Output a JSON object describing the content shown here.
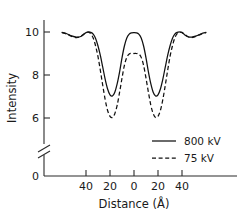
{
  "chart_data": {
    "type": "line",
    "title": "",
    "xlabel": "Distance (Å)",
    "ylabel": "Intensity",
    "xlim": [
      -60,
      60
    ],
    "ylim_display": [
      0,
      10.6
    ],
    "y_axis_break": true,
    "y_axis_break_note": "axis broken between 0 and ~5.2",
    "grid": false,
    "legend_position": "lower-right",
    "xticks": [
      -40,
      -20,
      0,
      20,
      40
    ],
    "xtick_labels": [
      "40",
      "20",
      "0",
      "20",
      "40"
    ],
    "yticks": [
      6,
      8,
      10,
      0
    ],
    "ytick_labels": [
      "6",
      "8",
      "10",
      "0"
    ],
    "series": [
      {
        "name": "800 kV",
        "style": "solid",
        "color": "#111111",
        "x": [
          -60,
          -56,
          -52,
          -48,
          -45,
          -42,
          -40,
          -38,
          -36,
          -34,
          -32,
          -30,
          -28,
          -26,
          -24,
          -22,
          -20,
          -18,
          -16,
          -14,
          -12,
          -10,
          -8,
          -6,
          -4,
          -2,
          0,
          2,
          4,
          6,
          8,
          10,
          12,
          14,
          16,
          18,
          20,
          22,
          24,
          26,
          28,
          30,
          32,
          34,
          36,
          38,
          40,
          42,
          45,
          48,
          52,
          56,
          60
        ],
        "y": [
          9.98,
          9.92,
          9.82,
          9.76,
          9.78,
          9.88,
          9.97,
          10.0,
          9.98,
          9.9,
          9.7,
          9.35,
          8.9,
          8.35,
          7.8,
          7.35,
          7.08,
          7.02,
          7.2,
          7.6,
          8.15,
          8.8,
          9.35,
          9.72,
          9.9,
          9.96,
          9.97,
          9.96,
          9.9,
          9.72,
          9.35,
          8.8,
          8.15,
          7.6,
          7.2,
          7.02,
          7.08,
          7.35,
          7.8,
          8.35,
          8.9,
          9.35,
          9.7,
          9.9,
          9.98,
          10.0,
          9.97,
          9.88,
          9.78,
          9.76,
          9.82,
          9.92,
          9.98
        ]
      },
      {
        "name": "75 kV",
        "style": "dashed",
        "color": "#111111",
        "x": [
          -60,
          -56,
          -52,
          -48,
          -45,
          -42,
          -40,
          -38,
          -36,
          -34,
          -32,
          -30,
          -28,
          -26,
          -24,
          -22,
          -20,
          -18,
          -16,
          -14,
          -12,
          -10,
          -8,
          -6,
          -4,
          -2,
          0,
          2,
          4,
          6,
          8,
          10,
          12,
          14,
          16,
          18,
          20,
          22,
          24,
          26,
          28,
          30,
          32,
          34,
          36,
          38,
          40,
          42,
          45,
          48,
          52,
          56,
          60
        ],
        "y": [
          9.97,
          9.9,
          9.8,
          9.74,
          9.78,
          9.9,
          9.98,
          9.99,
          9.92,
          9.72,
          9.35,
          8.85,
          8.2,
          7.5,
          6.85,
          6.35,
          6.08,
          6.02,
          6.2,
          6.6,
          7.2,
          7.85,
          8.45,
          8.82,
          8.98,
          9.0,
          9.0,
          9.0,
          8.98,
          8.82,
          8.45,
          7.85,
          7.2,
          6.6,
          6.2,
          6.02,
          6.08,
          6.35,
          6.85,
          7.5,
          8.2,
          8.85,
          9.35,
          9.72,
          9.92,
          9.99,
          9.98,
          9.9,
          9.78,
          9.74,
          9.8,
          9.9,
          9.97
        ]
      }
    ],
    "annotations": {
      "peak_center_solid": 10.0,
      "peak_center_dashed": 9.0,
      "valley_min_solid": 7.0,
      "valley_min_dashed": 6.0,
      "valley_positions": [
        -20,
        20
      ]
    }
  },
  "axes": {
    "ylabel": "Intensity",
    "xlabel": "Distance (Å)",
    "ytick_labels": [
      "10",
      "8",
      "6",
      "0"
    ],
    "xtick_labels": [
      "40",
      "20",
      "0",
      "20",
      "40"
    ]
  },
  "legend": {
    "entries": [
      {
        "label": "800 kV",
        "style": "solid"
      },
      {
        "label": "75 kV",
        "style": "dashed"
      }
    ]
  },
  "colors": {
    "curve": "#111111",
    "axis": "#2b2b2b",
    "background": "#ffffff"
  }
}
